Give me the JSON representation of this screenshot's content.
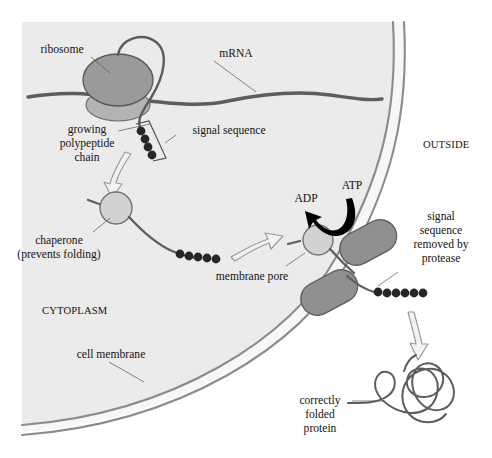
{
  "figure": {
    "width": 492,
    "height": 458,
    "background_color": "#ffffff",
    "cytoplasm_fill": "#ebebeb",
    "outside_fill": "#ffffff",
    "membrane_line_color": "#8c8c8c",
    "chain_color": "#5d5d5d",
    "bead_color": "#262626",
    "ribosome_color_large": "#9a9a9a",
    "ribosome_color_small": "#b3b3b3",
    "chaperone_color": "#d2d2d2",
    "pore_color": "#8f8f8f",
    "arrow_outline_color": "#9a9a9a",
    "atp_arrow_color": "#000000",
    "leader_color": "#5d5d5d",
    "text_color": "#15130f"
  },
  "labels": {
    "ribosome": "ribosome",
    "mrna": "mRNA",
    "growing_polypeptide_chain": [
      "growing",
      "polypeptide",
      "chain"
    ],
    "signal_sequence": "signal sequence",
    "chaperone": [
      "chaperone",
      "(prevents folding)"
    ],
    "membrane_pore": "membrane pore",
    "cytoplasm": "CYTOPLASM",
    "outside": "OUTSIDE",
    "cell_membrane": "cell membrane",
    "adp": "ADP",
    "atp": "ATP",
    "signal_sequence_removed": [
      "signal",
      "sequence",
      "removed by",
      "protease"
    ],
    "correctly_folded_protein": [
      "correctly",
      "folded",
      "protein"
    ]
  },
  "beads": {
    "signal_sequence_on_nascent_chain": 4,
    "signal_sequence_on_chaperone_chain": 5,
    "signal_sequence_cleaved_outside": 6
  },
  "structures": {
    "ribosome_large_subunit": "ellipse",
    "ribosome_small_subunit": "ellipse",
    "chaperone_1": "circle",
    "chaperone_2": "circle",
    "membrane_pore_subunit_upper": "capsule",
    "membrane_pore_subunit_lower": "capsule",
    "folded_protein": "squiggle-coil"
  },
  "arrows": {
    "outline_arrow_1": "ribosome-to-chaperone",
    "outline_arrow_2": "chaperone-to-pore",
    "outline_arrow_3": "pore-to-folded-protein",
    "atp_hydrolysis_arrow": "ATP to ADP"
  }
}
